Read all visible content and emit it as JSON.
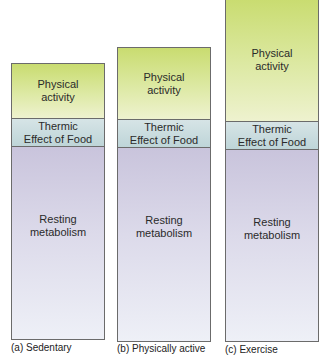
{
  "bars": [
    {
      "label": "(a) Sedentary",
      "segments": {
        "physical_activity": [
          "Physical",
          "activity"
        ],
        "thermic": [
          "Thermic",
          "Effect of Food"
        ],
        "resting": [
          "Resting",
          "metabolism"
        ]
      }
    },
    {
      "label": "(b) Physically active",
      "segments": {
        "physical_activity": [
          "Physical",
          "activity"
        ],
        "thermic": [
          "Thermic",
          "Effect of Food"
        ],
        "resting": [
          "Resting",
          "metabolism"
        ]
      }
    },
    {
      "label": "(c) Exercise",
      "segments": {
        "physical_activity": [
          "Physical",
          "activity"
        ],
        "thermic": [
          "Thermic",
          "Effect of Food"
        ],
        "resting": [
          "Resting",
          "metabolism"
        ]
      }
    }
  ],
  "colors": {
    "physical_activity": "#d4e38a",
    "thermic": "#c8dcdf",
    "resting": "#d9d6e8",
    "border": "#6b6b6b"
  }
}
